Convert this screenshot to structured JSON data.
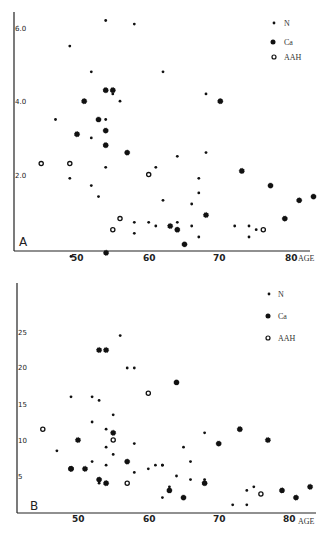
{
  "chart_data": [
    {
      "type": "scatter",
      "panel": "A",
      "xlabel": "AGE",
      "ylabel": "",
      "x_ticks": [
        "50",
        "60",
        "70",
        "80"
      ],
      "y_ticks": [
        "2.0",
        "4.0",
        "6.0"
      ],
      "xlim": [
        41,
        83
      ],
      "ylim": [
        0,
        6.5
      ],
      "legend": [
        "N",
        "Ca",
        "AAH"
      ],
      "legend_position": "upper right",
      "grid": false,
      "series": [
        {
          "name": "N",
          "marker": "small-dot",
          "points": [
            [
              54,
              6.2
            ],
            [
              58,
              6.1
            ],
            [
              49,
              5.5
            ],
            [
              62,
              4.8
            ],
            [
              52,
              4.8
            ],
            [
              68,
              4.2
            ],
            [
              55,
              4.2
            ],
            [
              56,
              4.0
            ],
            [
              47,
              3.5
            ],
            [
              54,
              3.5
            ],
            [
              52,
              3.0
            ],
            [
              54,
              2.8
            ],
            [
              61,
              2.2
            ],
            [
              64,
              2.5
            ],
            [
              68,
              2.6
            ],
            [
              52,
              1.7
            ],
            [
              49,
              1.9
            ],
            [
              54,
              2.2
            ],
            [
              67,
              1.5
            ],
            [
              53,
              1.4
            ],
            [
              62,
              1.3
            ],
            [
              58,
              0.7
            ],
            [
              60,
              0.7
            ],
            [
              61,
              0.6
            ],
            [
              64,
              0.7
            ],
            [
              66,
              0.6
            ],
            [
              67,
              0.3
            ],
            [
              72,
              0.6
            ],
            [
              74,
              0.6
            ],
            [
              75,
              0.5
            ],
            [
              74,
              0.3
            ],
            [
              58,
              0.4
            ],
            [
              67,
              1.9
            ],
            [
              66,
              1.2
            ]
          ]
        },
        {
          "name": "Ca",
          "marker": "star-dot",
          "points": [
            [
              54,
              4.3
            ],
            [
              55,
              4.3
            ],
            [
              51,
              4.0
            ],
            [
              70,
              4.0
            ],
            [
              50,
              3.1
            ],
            [
              53,
              3.5
            ],
            [
              54,
              3.2
            ],
            [
              54,
              2.8
            ],
            [
              57,
              2.6
            ],
            [
              73,
              2.1
            ],
            [
              77,
              1.7
            ],
            [
              81,
              1.3
            ],
            [
              83,
              1.4
            ],
            [
              79,
              0.8
            ],
            [
              68,
              0.9
            ],
            [
              63,
              0.6
            ],
            [
              64,
              0.5
            ],
            [
              65,
              0.1
            ]
          ]
        },
        {
          "name": "AAH",
          "marker": "open-circle",
          "points": [
            [
              45,
              2.3
            ],
            [
              49,
              2.3
            ],
            [
              60,
              2.0
            ],
            [
              56,
              0.8
            ],
            [
              55,
              0.5
            ],
            [
              76,
              0.5
            ]
          ]
        }
      ]
    },
    {
      "type": "scatter",
      "panel": "B",
      "xlabel": "AGE",
      "ylabel": "",
      "x_ticks": [
        "50",
        "60",
        "70",
        "80"
      ],
      "y_ticks": [
        "5",
        "10",
        "15",
        "20",
        "25"
      ],
      "xlim": [
        41,
        83
      ],
      "ylim": [
        0,
        36
      ],
      "legend": [
        "N",
        "Ca",
        "AAH"
      ],
      "legend_position": "upper right",
      "grid": false,
      "series": [
        {
          "name": "N",
          "marker": "small-dot",
          "points": [
            [
              49,
              35.5
            ],
            [
              56,
              24.5
            ],
            [
              58,
              20
            ],
            [
              49,
              16
            ],
            [
              52,
              16
            ],
            [
              55,
              13.5
            ],
            [
              57,
              20
            ],
            [
              53,
              15.5
            ],
            [
              52,
              12.5
            ],
            [
              54,
              11.5
            ],
            [
              47,
              8.5
            ],
            [
              52,
              7
            ],
            [
              54,
              6.5
            ],
            [
              54,
              9
            ],
            [
              55,
              8
            ],
            [
              58,
              9.5
            ],
            [
              58,
              5.5
            ],
            [
              53,
              4
            ],
            [
              60,
              6
            ],
            [
              61,
              6.5
            ],
            [
              62,
              6.5
            ],
            [
              62,
              2
            ],
            [
              63,
              3.5
            ],
            [
              64,
              5
            ],
            [
              66,
              7
            ],
            [
              65,
              9
            ],
            [
              68,
              4
            ],
            [
              68,
              4.5
            ],
            [
              68,
              11
            ],
            [
              72,
              1
            ],
            [
              74,
              3
            ],
            [
              74,
              1
            ],
            [
              75,
              3.5
            ],
            [
              62,
              6.5
            ],
            [
              66,
              4.5
            ]
          ]
        },
        {
          "name": "Ca",
          "marker": "star-dot",
          "points": [
            [
              54,
              36
            ],
            [
              53,
              22.5
            ],
            [
              54,
              22.5
            ],
            [
              64,
              18
            ],
            [
              50,
              10
            ],
            [
              55,
              11
            ],
            [
              57,
              7
            ],
            [
              49,
              6
            ],
            [
              53,
              4.5
            ],
            [
              51,
              6
            ],
            [
              54,
              4
            ],
            [
              63,
              3
            ],
            [
              65,
              2
            ],
            [
              68,
              4
            ],
            [
              70,
              9.5
            ],
            [
              73,
              11.5
            ],
            [
              77,
              10
            ],
            [
              79,
              3
            ],
            [
              81,
              2
            ],
            [
              83,
              3.5
            ]
          ]
        },
        {
          "name": "AAH",
          "marker": "open-circle",
          "points": [
            [
              45,
              11.5
            ],
            [
              49,
              6
            ],
            [
              55,
              10
            ],
            [
              60,
              16.5
            ],
            [
              57,
              4
            ],
            [
              76,
              2.5
            ]
          ]
        }
      ]
    }
  ],
  "legend": {
    "n_label": "N",
    "ca_label": "Ca",
    "aah_label": "AAH"
  },
  "panels": {
    "a_label": "A",
    "b_label": "B"
  },
  "axis": {
    "age_label": "AGE",
    "x_ticks": [
      "50",
      "60",
      "70",
      "80"
    ],
    "a_y_ticks": [
      "2.0",
      "4.0",
      "6.0"
    ],
    "b_y_ticks": [
      "5",
      "10",
      "15",
      "20",
      "25"
    ]
  }
}
